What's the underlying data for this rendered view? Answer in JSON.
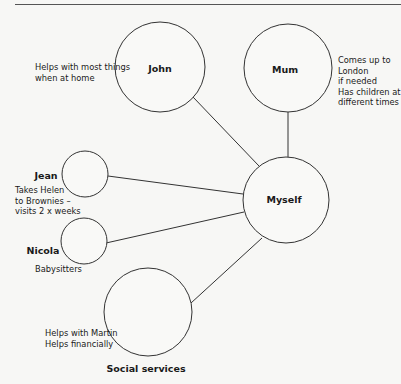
{
  "diagram": {
    "type": "ecomap",
    "nodes": [
      {
        "id": "john",
        "label": "John",
        "cx": 160,
        "cy": 67,
        "r": 45,
        "note": "Helps with most things\nwhen at home"
      },
      {
        "id": "mum",
        "label": "Mum",
        "cx": 288,
        "cy": 68,
        "r": 44,
        "note": "Comes up to\nLondon\nif needed\nHas children at\ndifferent times"
      },
      {
        "id": "myself",
        "label": "Myself",
        "cx": 286,
        "cy": 200,
        "r": 43
      },
      {
        "id": "jean",
        "label": "Jean",
        "cx": 85,
        "cy": 174,
        "r": 23,
        "note": "Takes Helen\nto Brownies –\nvisits 2 x weeks"
      },
      {
        "id": "nicola",
        "label": "Nicola",
        "cx": 84,
        "cy": 241,
        "r": 23,
        "note": "Babysitters"
      },
      {
        "id": "social",
        "label": "Social services",
        "cx": 148,
        "cy": 312,
        "r": 44,
        "note": "Helps with Martin\nHelps financially"
      }
    ],
    "edges": [
      {
        "from": "john",
        "to": "myself"
      },
      {
        "from": "mum",
        "to": "myself"
      },
      {
        "from": "jean",
        "to": "myself"
      },
      {
        "from": "nicola",
        "to": "myself"
      },
      {
        "from": "social",
        "to": "myself"
      }
    ]
  },
  "labels": {
    "john": "John",
    "mum": "Mum",
    "myself": "Myself",
    "jean": "Jean",
    "nicola": "Nicola",
    "social": "Social services"
  },
  "notes": {
    "john": "Helps with most things\nwhen at home",
    "mum": "Comes up to\nLondon\nif needed\nHas children at\ndifferent times",
    "jean": "Takes Helen\nto Brownies –\nvisits 2 x weeks",
    "nicola": "Babysitters",
    "social": "Helps with Martin\nHelps financially"
  }
}
